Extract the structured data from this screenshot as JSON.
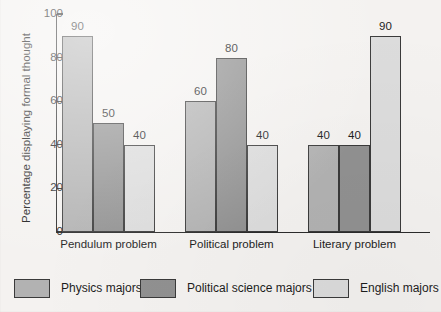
{
  "chart_data": {
    "type": "bar",
    "title": "",
    "xlabel": "",
    "ylabel": "Percentage displaying formal thought",
    "ylim": [
      0,
      100
    ],
    "ytick_labels": [
      "0",
      "20",
      "40",
      "60",
      "80",
      "100"
    ],
    "ytick_values": [
      0,
      20,
      40,
      60,
      80,
      100
    ],
    "grid": false,
    "legend_position": "bottom",
    "categories": [
      "Pendulum problem",
      "Political problem",
      "Literary problem"
    ],
    "series": [
      {
        "name": "Physics majors",
        "color": "#b2b2b2",
        "values": [
          90,
          60,
          40
        ],
        "value_labels": [
          "90",
          "60",
          "40"
        ]
      },
      {
        "name": "Political science majors",
        "color": "#919191",
        "values": [
          50,
          80,
          40
        ],
        "value_labels": [
          "50",
          "80",
          "40"
        ]
      },
      {
        "name": "English majors",
        "color": "#dcdcdc",
        "values": [
          40,
          40,
          90
        ],
        "value_labels": [
          "40",
          "40",
          "90"
        ]
      }
    ]
  },
  "colors": {
    "background": "#f4f2f0",
    "axis": "#2b2b2b",
    "text": "#1d1d1d",
    "bar_outline": "#3a3a3a"
  }
}
